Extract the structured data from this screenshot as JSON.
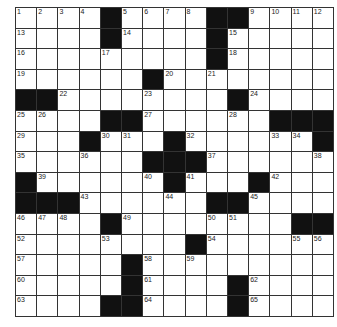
{
  "puzzle": {
    "rows": 15,
    "cols": 15,
    "colors": {
      "black": "#111111",
      "white": "#ffffff",
      "line": "#333333"
    },
    "grid": [
      "....#....##....",
      "....#....#.....",
      ".........#.....",
      "......#........",
      "##........#....",
      "....##.....####"
    ],
    "layout": [
      [
        1,
        2,
        3,
        4,
        "#",
        5,
        6,
        7,
        8,
        "#",
        "#",
        9,
        10,
        11,
        12
      ],
      [
        13,
        0,
        0,
        0,
        "#",
        14,
        0,
        0,
        0,
        "#",
        15,
        0,
        0,
        0,
        0
      ],
      [
        16,
        0,
        0,
        0,
        17,
        0,
        0,
        0,
        0,
        "#",
        18,
        0,
        0,
        0,
        0
      ],
      [
        19,
        0,
        0,
        0,
        0,
        0,
        "#",
        20,
        0,
        21,
        0,
        0,
        0,
        0,
        0
      ],
      [
        "#",
        "#",
        22,
        0,
        0,
        0,
        23,
        0,
        0,
        0,
        "#",
        24,
        0,
        0,
        0
      ],
      [
        25,
        26,
        0,
        0,
        "#",
        "#",
        27,
        0,
        0,
        0,
        28,
        0,
        "#",
        "#",
        "#"
      ],
      [
        29,
        0,
        0,
        "#",
        30,
        31,
        0,
        "#",
        32,
        0,
        0,
        0,
        33,
        34,
        "#"
      ],
      [
        35,
        0,
        0,
        36,
        0,
        0,
        "#",
        "#",
        "#",
        37,
        0,
        0,
        0,
        0,
        38
      ],
      [
        "#",
        39,
        0,
        0,
        0,
        0,
        40,
        "#",
        41,
        0,
        0,
        "#",
        42,
        0,
        0
      ],
      [
        "#",
        "#",
        "#",
        43,
        0,
        0,
        0,
        44,
        0,
        "#",
        "#",
        45,
        0,
        0,
        0
      ],
      [
        46,
        47,
        48,
        0,
        "#",
        49,
        0,
        0,
        0,
        50,
        51,
        0,
        0,
        "#",
        "#"
      ],
      [
        52,
        0,
        0,
        0,
        53,
        0,
        0,
        0,
        "#",
        54,
        0,
        0,
        0,
        55,
        56
      ],
      [
        57,
        0,
        0,
        0,
        0,
        "#",
        58,
        0,
        59,
        0,
        0,
        0,
        0,
        0,
        0
      ],
      [
        60,
        0,
        0,
        0,
        0,
        "#",
        61,
        0,
        0,
        0,
        "#",
        62,
        0,
        0,
        0
      ],
      [
        63,
        0,
        0,
        0,
        "#",
        "#",
        64,
        0,
        0,
        0,
        "#",
        65,
        0,
        0,
        0
      ]
    ]
  }
}
